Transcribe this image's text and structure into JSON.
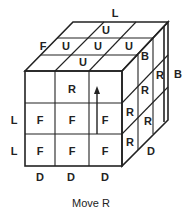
{
  "diagram": {
    "caption": "Move R",
    "outer_labels": {
      "top": "L",
      "top_left": "F",
      "right": "B",
      "left_row2": "L",
      "left_row3": "L",
      "bottom_col1": "D",
      "bottom_col2": "D",
      "bottom_col3": "D",
      "right_bottom": "D"
    },
    "top_face": [
      "U",
      "U",
      "U",
      "U",
      "U"
    ],
    "front_face": {
      "row1": [
        "",
        "R",
        ""
      ],
      "row2": [
        "F",
        "F",
        "F"
      ],
      "row3": [
        "F",
        "F",
        "F"
      ]
    },
    "right_face": {
      "top": [
        "B"
      ],
      "middle": [
        "R",
        "R"
      ],
      "lower": [
        "R",
        "R"
      ],
      "back_slice": [
        "R"
      ]
    },
    "arrow": "up-arrow"
  }
}
